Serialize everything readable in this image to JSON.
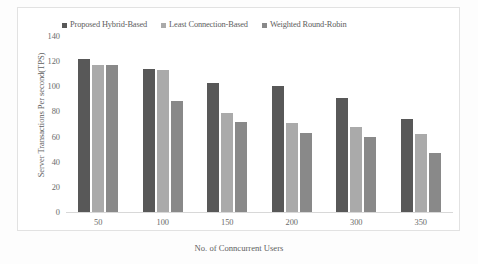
{
  "chart_data": {
    "type": "bar",
    "title": "",
    "xlabel": "No. of Conncurrent Users",
    "ylabel": "Server Transactions Per second(TPS)",
    "categories": [
      "50",
      "100",
      "150",
      "200",
      "300",
      "350"
    ],
    "series": [
      {
        "name": "Proposed Hybrid-Based",
        "color": "#585858",
        "values": [
          122,
          114,
          103,
          100,
          91,
          74
        ]
      },
      {
        "name": "Least Connection-Based",
        "color": "#aaaaaa",
        "values": [
          117,
          113,
          79,
          71,
          68,
          62
        ]
      },
      {
        "name": "Weighted  Round-Robin",
        "color": "#898989",
        "values": [
          117,
          88,
          72,
          63,
          60,
          47
        ]
      }
    ],
    "ylim": [
      0,
      140
    ],
    "yticks": [
      "0",
      "20",
      "40",
      "60",
      "80",
      "100",
      "120",
      "140"
    ],
    "ytick_values": [
      0,
      20,
      40,
      60,
      80,
      100,
      120,
      140
    ],
    "grid": false,
    "legend_position": "top"
  },
  "figure": {
    "caption": ""
  }
}
